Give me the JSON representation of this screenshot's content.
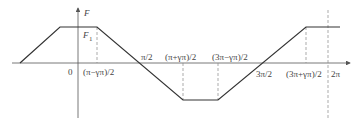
{
  "diagram": {
    "type": "piecewise-linear trapezoidal waveform",
    "axes": {
      "y_label": "F",
      "origin_label": "0"
    },
    "level_label": "F",
    "level_subscript": "1",
    "x_labels": [
      {
        "id": "a",
        "text": "(π−γπ)/2"
      },
      {
        "id": "b",
        "text": "π/2"
      },
      {
        "id": "c",
        "text": "(π+γπ)/2"
      },
      {
        "id": "d",
        "text": "(3π−γπ)/2"
      },
      {
        "id": "e",
        "text": "3π/2"
      },
      {
        "id": "f",
        "text": "(3π+γπ)/2"
      },
      {
        "id": "g",
        "text": "2π"
      }
    ],
    "colors": {
      "line": "#333333",
      "axis": "#555555",
      "dashed": "#888888",
      "text": "#444444"
    }
  }
}
